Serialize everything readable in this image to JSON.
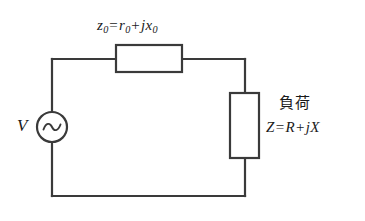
{
  "figure": {
    "background_color": "#ffffff",
    "line_color": "#3a3a3a",
    "text_color": "#1a1a1a"
  },
  "source": {
    "label": "V",
    "symbol": "ac-source-sine"
  },
  "series_impedance": {
    "symbol": "z",
    "symbol_sub": "0",
    "equals": "=",
    "real": "r",
    "real_sub": "0",
    "plus": "+",
    "imag_unit": "j",
    "imag": "x",
    "imag_sub": "0",
    "full_text": "z0 = r0 + jx0"
  },
  "load": {
    "name": "負荷",
    "symbol": "Z",
    "equals": "=",
    "real": "R",
    "plus": "+",
    "imag_unit": "j",
    "imag": "X",
    "full_text": "Z = R + jX"
  }
}
